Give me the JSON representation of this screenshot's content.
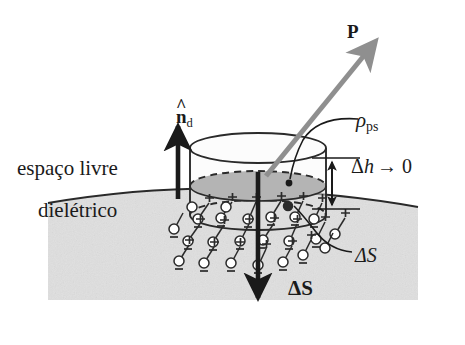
{
  "figure": {
    "domain": "diagram",
    "language": "pt-BR",
    "canvas": {
      "width": 465,
      "height": 345
    },
    "colors": {
      "background": "#ffffff",
      "dielectric_fill": "#e4e4e4",
      "ellipse_surface_fill": "#b4b4b4",
      "cylinder_top_fill": "#fbfbfb",
      "cylinder_body_fill": "#dcdcdc",
      "ink": "#1a1a1a",
      "polarization_arrow": "#8f8f8f",
      "line": "#2a2a2a"
    }
  },
  "labels": {
    "polarization_vector": "P",
    "bound_surface_charge": "ρ",
    "bound_surface_charge_sub": "ps",
    "normal_unit_vector": "n",
    "normal_unit_vector_sub": "d",
    "free_space": "espaço livre",
    "dielectric": "dielétrico",
    "delta_h": "Δh",
    "delta_h_limit": "→ 0",
    "delta_S_area": "ΔS",
    "delta_S_vector": "ΔS"
  },
  "annotations": [
    {
      "name": "polarization-vector-arrow",
      "label": "P",
      "style": "gray bold arrow pointing up-right from center of interface ellipse",
      "tail": [
        268,
        170
      ],
      "head": [
        377,
        40
      ]
    },
    {
      "name": "normal-unit-vector-arrow",
      "label": "n-hat-d",
      "style": "black arrow pointing straight up from free-space side of boundary",
      "tail": [
        178,
        198
      ],
      "head": [
        178,
        124
      ]
    },
    {
      "name": "delta-S-vector-arrow",
      "label": "Delta-S bold",
      "style": "black arrow pointing straight down through the pillbox into the dielectric",
      "tail": [
        258,
        170
      ],
      "head": [
        258,
        300
      ]
    },
    {
      "name": "delta-h-dimension",
      "label": "Delta-h to 0",
      "style": "double headed vertical dimension arrow at right of pillbox",
      "top": [
        332,
        160
      ],
      "bottom": [
        332,
        208
      ]
    },
    {
      "name": "rho-ps-leader",
      "label": "rho_ps",
      "style": "curved leader ending with a dot on the gray interface ellipse"
    },
    {
      "name": "delta-S-area-leader",
      "label": "Delta-S italic",
      "style": "curved leader from dielectric side of the pillbox out to the right"
    }
  ],
  "geometry": {
    "dielectric_rect": {
      "x": 48,
      "y": 60,
      "width": 370,
      "height": 240
    },
    "boundary_curve": "arc sagging from y=203 at left edge up to y=189 near x=240 then down to y=207 at right edge",
    "pillbox": {
      "center_x": 258,
      "top_ellipse_cy": 148,
      "interface_ellipse_cy": 186,
      "bottom_ellipse_cy": 215,
      "rx": 68,
      "ry": 15
    },
    "dipole_count": 24,
    "dipole_description": "plus sign joined by short stalk to small open circle carrying a minus sign, arranged in rows below the pillbox"
  }
}
